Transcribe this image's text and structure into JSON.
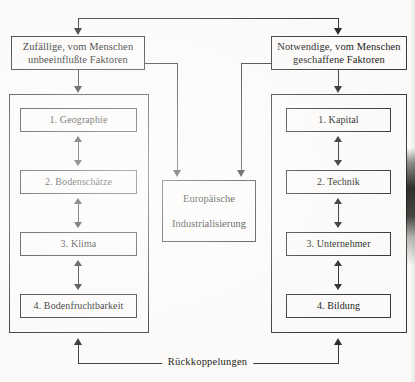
{
  "diagram": {
    "title_text": "",
    "header_left": {
      "line1": "Zufällige, vom Menschen",
      "line2": "unbeeinflußte Faktoren"
    },
    "header_right": {
      "line1": "Notwendige, vom Menschen",
      "line2": "geschaffene Faktoren"
    },
    "center": {
      "line1": "Europäische",
      "line2": "Industrialisierung"
    },
    "left_column": [
      "1. Geographie",
      "2. Bodenschätze",
      "3. Klima",
      "4. Bodenfruchtbarkeit"
    ],
    "right_column": [
      "1. Kapital",
      "2. Technik",
      "3. Unternehmer",
      "4. Bildung"
    ],
    "feedback_label": "Rückkoppelungen",
    "colors": {
      "ink": "#3a3a3a",
      "paper": "#fbfaf8",
      "arrow": "#2b2b2b"
    }
  }
}
